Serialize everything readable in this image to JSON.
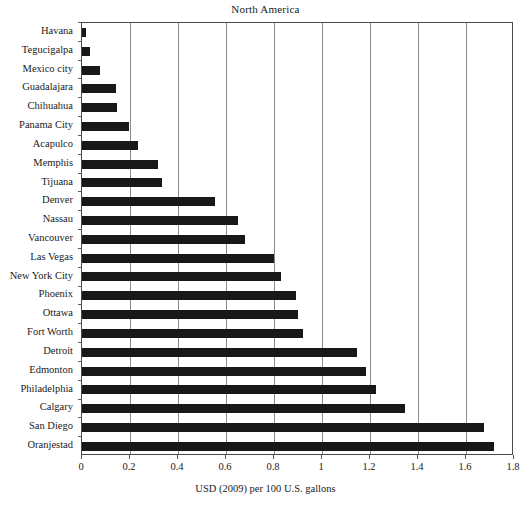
{
  "chart_data": {
    "type": "bar",
    "orientation": "horizontal",
    "title": "North America",
    "xlabel": "USD (2009) per 100 U.S. gallons",
    "ylabel": "",
    "xlim": [
      0,
      1.8
    ],
    "xticks": [
      "0",
      "0.2",
      "0.4",
      "0.6",
      "0.8",
      "1",
      "1.2",
      "1.4",
      "1.6",
      "1.8"
    ],
    "xtick_values": [
      0,
      0.2,
      0.4,
      0.6,
      0.8,
      1.0,
      1.2,
      1.4,
      1.6,
      1.8
    ],
    "grid": "vertical",
    "legend": null,
    "bar_color": "#181818",
    "categories": [
      "Havana",
      "Tegucigalpa",
      "Mexico city",
      "Guadalajara",
      "Chihuahua",
      "Panama City",
      "Acapulco",
      "Memphis",
      "Tijuana",
      "Denver",
      "Nassau",
      "Vancouver",
      "Las Vegas",
      "New York City",
      "Phoenix",
      "Ottawa",
      "Fort Worth",
      "Detroit",
      "Edmonton",
      "Philadelphia",
      "Calgary",
      "San Diego",
      "Oranjestad"
    ],
    "values": [
      0.015,
      0.035,
      0.073,
      0.143,
      0.147,
      0.195,
      0.233,
      0.315,
      0.333,
      0.555,
      0.65,
      0.68,
      0.8,
      0.83,
      0.89,
      0.9,
      0.92,
      1.145,
      1.185,
      1.225,
      1.345,
      1.675,
      1.715
    ]
  }
}
